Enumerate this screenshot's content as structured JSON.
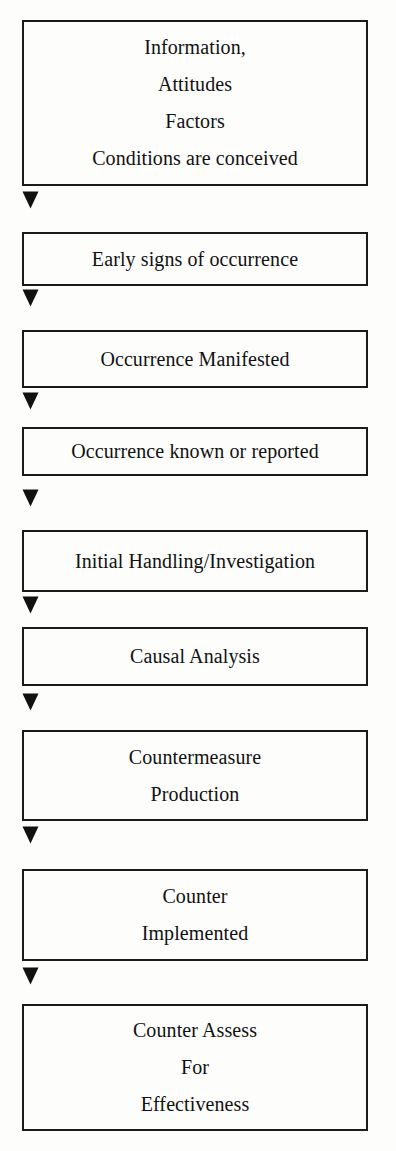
{
  "diagram": {
    "type": "flowchart",
    "orientation": "vertical",
    "background_color": "#fdfdfc",
    "border_color": "#1b1b1b",
    "text_color": "#111111",
    "connector_icon": "triangle-down-icon",
    "connector_glyph": "▼",
    "nodes": [
      {
        "id": "node-1",
        "name": "information-attitudes-factors-conditions",
        "lines": [
          "Information,",
          "Attitudes",
          "Factors",
          "Conditions are conceived"
        ]
      },
      {
        "id": "node-2",
        "name": "early-signs-of-occurrence",
        "lines": [
          "Early signs of occurrence"
        ]
      },
      {
        "id": "node-3",
        "name": "occurrence-manifested",
        "lines": [
          "Occurrence Manifested"
        ]
      },
      {
        "id": "node-4",
        "name": "occurrence-known-or-reported",
        "lines": [
          "Occurrence known or reported"
        ]
      },
      {
        "id": "node-5",
        "name": "initial-handling-investigation",
        "lines": [
          "Initial Handling/Investigation"
        ]
      },
      {
        "id": "node-6",
        "name": "causal-analysis",
        "lines": [
          "Causal Analysis"
        ]
      },
      {
        "id": "node-7",
        "name": "countermeasure-production",
        "lines": [
          "Countermeasure",
          "Production"
        ]
      },
      {
        "id": "node-8",
        "name": "counter-implemented",
        "lines": [
          "Counter",
          "Implemented"
        ]
      },
      {
        "id": "node-9",
        "name": "counter-assess-for-effectiveness",
        "lines": [
          "Counter Assess",
          "For",
          "Effectiveness"
        ]
      }
    ],
    "connectors": [
      {
        "id": "arrow-1",
        "from": "node-1",
        "to": "node-2"
      },
      {
        "id": "arrow-2",
        "from": "node-2",
        "to": "node-3"
      },
      {
        "id": "arrow-3",
        "from": "node-3",
        "to": "node-4"
      },
      {
        "id": "arrow-4",
        "from": "node-4",
        "to": "node-5"
      },
      {
        "id": "arrow-5",
        "from": "node-5",
        "to": "node-6"
      },
      {
        "id": "arrow-6",
        "from": "node-6",
        "to": "node-7"
      },
      {
        "id": "arrow-7",
        "from": "node-7",
        "to": "node-8"
      },
      {
        "id": "arrow-8",
        "from": "node-8",
        "to": "node-9"
      }
    ],
    "layout": {
      "node_boxes": [
        {
          "top": 20,
          "height": 166
        },
        {
          "top": 232,
          "height": 54
        },
        {
          "top": 330,
          "height": 58
        },
        {
          "top": 427,
          "height": 49
        },
        {
          "top": 530,
          "height": 62
        },
        {
          "top": 627,
          "height": 59
        },
        {
          "top": 730,
          "height": 91
        },
        {
          "top": 869,
          "height": 92
        },
        {
          "top": 1004,
          "height": 127
        }
      ],
      "arrow_tops": [
        191,
        289,
        392,
        489,
        596,
        693,
        826,
        967
      ]
    }
  }
}
